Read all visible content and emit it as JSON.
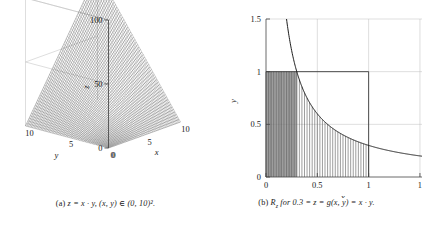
{
  "figure": {
    "background": "#ffffff",
    "ink": "#1a1a1a"
  },
  "panel_a": {
    "caption_label": "(a)",
    "caption_text": "z = x · y, (x, y) ∈ (0, 10)².",
    "chart_data": {
      "type": "line",
      "subtype": "3d-surface-wireframe",
      "title": "",
      "function": "z = x · y",
      "domain": "(0,10)²",
      "xlabel": "x",
      "ylabel": "y",
      "zlabel": "z",
      "xticks": [
        0,
        5,
        10
      ],
      "xticklabels": [
        "0",
        "5",
        "10"
      ],
      "yticks": [
        0,
        5,
        10
      ],
      "yticklabels": [
        "0",
        "5",
        "10"
      ],
      "zticks": [
        0,
        50,
        100
      ],
      "zticklabels": [
        "0",
        "50",
        "100"
      ],
      "xlim": [
        0,
        10
      ],
      "ylim": [
        0,
        10
      ],
      "zlim": [
        0,
        100
      ],
      "grid": true,
      "legend": false,
      "view": "azimuth -37.5, elevation 30",
      "mesh_lines": 60,
      "corner_values": [
        {
          "x": 0,
          "y": 0,
          "z": 0
        },
        {
          "x": 10,
          "y": 0,
          "z": 0
        },
        {
          "x": 0,
          "y": 10,
          "z": 0
        },
        {
          "x": 10,
          "y": 10,
          "z": 100
        }
      ]
    }
  },
  "panel_b": {
    "caption_label": "(b)",
    "caption_text": "R",
    "caption_sub": "z",
    "caption_rest": " for 0.3 = z = g(x, y) = x · y.",
    "chart_data": {
      "type": "area",
      "subtype": "hatched-region-under-hyperbola",
      "title": "",
      "xlabel": "x",
      "ylabel": "y",
      "xticks": [
        0,
        0.5,
        1,
        1.5
      ],
      "xticklabels": [
        "0",
        "0.5",
        "1",
        "1"
      ],
      "yticks": [
        0,
        0.5,
        1,
        1.5
      ],
      "yticklabels": [
        "0",
        "0.5",
        "1",
        "1.5"
      ],
      "xlim": [
        0,
        1.52
      ],
      "ylim": [
        0,
        1.5
      ],
      "grid": true,
      "legend": false,
      "curve_label": "y = 0.3 / x",
      "curve_constant": 0.3,
      "unit_square": {
        "x0": 0,
        "y0": 0,
        "x1": 1,
        "y1": 1
      },
      "region_x_range": [
        0,
        1
      ],
      "region_upper_bound": "min(1, 0.3/x)",
      "hatch_direction": "vertical",
      "hatch_count": 40,
      "shaded_subregion_x": [
        0,
        0.3
      ],
      "curve_points": [
        {
          "x": 0.2,
          "y": 1.5
        },
        {
          "x": 0.3,
          "y": 1.0
        },
        {
          "x": 0.4,
          "y": 0.75
        },
        {
          "x": 0.5,
          "y": 0.6
        },
        {
          "x": 0.6,
          "y": 0.5
        },
        {
          "x": 0.8,
          "y": 0.375
        },
        {
          "x": 1.0,
          "y": 0.3
        },
        {
          "x": 1.2,
          "y": 0.25
        },
        {
          "x": 1.5,
          "y": 0.2
        }
      ]
    }
  }
}
